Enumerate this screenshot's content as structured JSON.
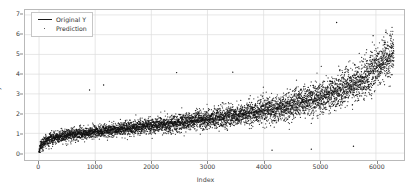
{
  "chart_data": {
    "type": "scatter",
    "title": "",
    "xlabel": "Index",
    "ylabel": "y",
    "xlim": [
      -250,
      6500
    ],
    "ylim": [
      -0.35,
      7.25
    ],
    "xticks": [
      0,
      1000,
      2000,
      3000,
      4000,
      5000,
      6000
    ],
    "xticklabels": [
      "0",
      "1000",
      "2000",
      "3000",
      "4000",
      "5000",
      "6000"
    ],
    "yticks": [
      0,
      1,
      2,
      3,
      4,
      5,
      6,
      7
    ],
    "yticklabels": [
      "0",
      "1",
      "2",
      "3",
      "4",
      "5",
      "6",
      "7"
    ],
    "grid": true,
    "grid_color": "#dcdcdc",
    "legend_position": "upper left",
    "point_color": "#111111",
    "line_color": "#111111",
    "background": "#ffffff",
    "frame_color": "#b9b9b9",
    "series": [
      {
        "name": "Original Y",
        "kind": "line",
        "description": "Monotonic sorted target curve rising from 0 at index 0 to about 5.1 at index 6300",
        "x": [
          0,
          15,
          35,
          70,
          120,
          200,
          320,
          500,
          750,
          1000,
          1300,
          1600,
          1900,
          2200,
          2500,
          2800,
          3100,
          3400,
          3700,
          4000,
          4300,
          4600,
          4900,
          5200,
          5500,
          5700,
          5900,
          6050,
          6150,
          6250,
          6320
        ],
        "y": [
          0.02,
          0.22,
          0.38,
          0.5,
          0.6,
          0.7,
          0.8,
          0.9,
          1.0,
          1.08,
          1.17,
          1.26,
          1.35,
          1.44,
          1.54,
          1.64,
          1.75,
          1.87,
          2.0,
          2.14,
          2.3,
          2.5,
          2.74,
          3.02,
          3.38,
          3.68,
          4.02,
          4.4,
          4.68,
          4.95,
          5.15
        ]
      },
      {
        "name": "Prediction",
        "kind": "scatter",
        "description": "Dense black point cloud about the Original Y curve; spread widens with index, from roughly +/-0.35 near index 0 to +/-1.3 near index 6300",
        "n_points": 6300,
        "spread_low": 0.35,
        "spread_high": 1.3,
        "outliers": [
          {
            "x": 5300,
            "y": 6.62
          },
          {
            "x": 2450,
            "y": 4.08
          },
          {
            "x": 3450,
            "y": 4.1
          },
          {
            "x": 1150,
            "y": 3.45
          },
          {
            "x": 900,
            "y": 3.2
          },
          {
            "x": 5950,
            "y": 5.95
          },
          {
            "x": 6150,
            "y": 5.6
          },
          {
            "x": 4150,
            "y": 0.15
          },
          {
            "x": 4850,
            "y": 0.2
          },
          {
            "x": 5600,
            "y": 0.35
          }
        ]
      }
    ]
  },
  "legend": {
    "entries": [
      {
        "label": "Original Y",
        "marker": "line"
      },
      {
        "label": "Prediction",
        "marker": "dot"
      }
    ]
  }
}
